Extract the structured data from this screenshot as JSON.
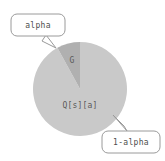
{
  "figure": {
    "title": "",
    "background_color": "#ffffff",
    "width": 165,
    "height": 161
  },
  "chart_data": {
    "type": "pie",
    "title": "",
    "xlabel": "",
    "ylabel": "",
    "legend_position": "none",
    "grid": false,
    "center": [
      80,
      89
    ],
    "radius": 47,
    "start_angle_deg": 90,
    "direction": "counterclockwise",
    "categories": [
      "G",
      "Q[s][a]"
    ],
    "values": [
      0.08,
      0.92
    ],
    "labels": [
      "G",
      "Q[s][a]"
    ],
    "colors": [
      "#b0b0b0",
      "#c9c9c9"
    ],
    "annotations": [
      "alpha",
      "1-alpha"
    ]
  },
  "slices": [
    {
      "name": "g-slice",
      "label": "G",
      "value": 0.08,
      "color": "#b0b0b0",
      "label_x": 72,
      "label_y": 60
    },
    {
      "name": "q-slice",
      "label": "Q[s][a]",
      "value": 0.92,
      "color": "#c9c9c9",
      "label_x": 80,
      "label_y": 105
    }
  ],
  "callouts": [
    {
      "name": "alpha-callout",
      "text": "alpha",
      "box_x": 11,
      "box_y": 14,
      "box_w": 54,
      "box_h": 22,
      "text_x": 38,
      "text_y": 25,
      "tail": "46,35 56,48 42,41",
      "border_color": "#9a9a9a",
      "fill_color": "#ffffff"
    },
    {
      "name": "one-minus-alpha-callout",
      "text": "1-alpha",
      "box_x": 102,
      "box_y": 131,
      "box_w": 58,
      "box_h": 22,
      "text_x": 131,
      "text_y": 142,
      "tail": "127,131 113,115 124,126",
      "border_color": "#9a9a9a",
      "fill_color": "#ffffff"
    }
  ]
}
